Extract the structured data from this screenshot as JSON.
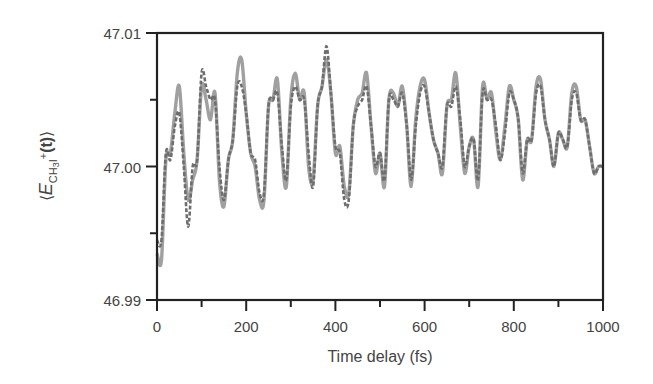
{
  "chart_data": {
    "type": "line",
    "title": "",
    "xlabel": "Time delay (fs)",
    "ylabel": "⟨E_CH3I+(t)⟩",
    "ylabel_parts": {
      "open": "⟨",
      "E": "E",
      "sub": "CH",
      "sub3": "3",
      "subI": "I",
      "sup": "+",
      "t": "(t)",
      "close": "⟩"
    },
    "xlim": [
      0,
      1000
    ],
    "ylim": [
      46.99,
      47.01
    ],
    "x_ticks": [
      0,
      200,
      400,
      600,
      800,
      1000
    ],
    "x_tick_labels": [
      "0",
      "200",
      "400",
      "600",
      "800",
      "1000"
    ],
    "x_minor_ticks": [
      100,
      300,
      500,
      700,
      900
    ],
    "y_ticks": [
      46.99,
      47.0,
      47.01
    ],
    "y_tick_labels": [
      "46.99",
      "47.00",
      "47.01"
    ],
    "y_minor_ticks": [
      46.995,
      47.005
    ],
    "grid": false,
    "legend": null,
    "series": [
      {
        "name": "solid",
        "style": "solid",
        "color": "#a0a0a0",
        "x": [
          0,
          10,
          20,
          30,
          40,
          50,
          60,
          70,
          80,
          90,
          100,
          110,
          120,
          130,
          140,
          150,
          160,
          170,
          180,
          190,
          200,
          210,
          220,
          230,
          240,
          250,
          260,
          270,
          280,
          290,
          300,
          310,
          320,
          330,
          340,
          350,
          360,
          370,
          380,
          390,
          400,
          410,
          420,
          430,
          440,
          450,
          460,
          470,
          480,
          490,
          500,
          510,
          520,
          530,
          540,
          550,
          560,
          570,
          580,
          590,
          600,
          610,
          620,
          630,
          640,
          650,
          660,
          670,
          680,
          690,
          700,
          710,
          720,
          730,
          740,
          750,
          760,
          770,
          780,
          790,
          800,
          810,
          820,
          830,
          840,
          850,
          860,
          870,
          880,
          890,
          900,
          910,
          920,
          930,
          940,
          950,
          960,
          970,
          980,
          990,
          1000
        ],
        "y": [
          46.9935,
          46.993,
          47.0005,
          47.001,
          47.004,
          47.006,
          47.001,
          46.9975,
          46.999,
          47.0005,
          47.006,
          47.005,
          47.0035,
          47.0055,
          46.999,
          46.997,
          47.0005,
          47.002,
          47.007,
          47.008,
          47.004,
          47.001,
          47.0,
          46.9975,
          46.9975,
          47.0045,
          47.005,
          47.0065,
          47.001,
          46.9985,
          47.005,
          47.007,
          47.005,
          47.0055,
          47.0,
          46.999,
          47.0045,
          47.006,
          47.008,
          47.0055,
          47.001,
          47.0015,
          46.9985,
          46.998,
          47.003,
          47.005,
          47.0055,
          47.007,
          47.003,
          46.9995,
          47.001,
          46.9985,
          47.005,
          47.0055,
          47.0045,
          47.006,
          47.003,
          46.9985,
          47.0035,
          47.006,
          47.0065,
          47.004,
          47.002,
          47.001,
          46.9995,
          47.0045,
          47.005,
          47.007,
          47.003,
          46.9995,
          47.0015,
          47.002,
          46.9985,
          47.006,
          47.005,
          47.0055,
          47.0025,
          47.0005,
          47.003,
          47.006,
          47.005,
          47.0035,
          46.999,
          47.002,
          47.002,
          47.006,
          47.0065,
          47.0035,
          47.002,
          47.0,
          47.0025,
          47.002,
          47.0015,
          47.0055,
          47.006,
          47.0035,
          47.0035,
          47.0015,
          46.9995,
          47.0,
          47.0
        ]
      },
      {
        "name": "dashed",
        "style": "dashed",
        "color": "#6e6e6e",
        "x": [
          0,
          10,
          20,
          30,
          40,
          50,
          60,
          70,
          80,
          90,
          100,
          110,
          120,
          130,
          140,
          150,
          160,
          170,
          180,
          190,
          200,
          210,
          220,
          230,
          240,
          250,
          260,
          270,
          280,
          290,
          300,
          310,
          320,
          330,
          340,
          350,
          360,
          370,
          380,
          390,
          400,
          410,
          420,
          430,
          440,
          450,
          460,
          470,
          480,
          490,
          500,
          510,
          520,
          530,
          540,
          550,
          560,
          570,
          580,
          590,
          600,
          610,
          620,
          630,
          640,
          650,
          660,
          670,
          680,
          690,
          700,
          710,
          720,
          730,
          740,
          750,
          760,
          770,
          780,
          790,
          800,
          810,
          820,
          830,
          840,
          850,
          860,
          870,
          880,
          890,
          900,
          910,
          920,
          930,
          940,
          950,
          960,
          970,
          980,
          990,
          1000
        ],
        "y": [
          46.9945,
          46.9945,
          47.001,
          47.0005,
          47.003,
          47.004,
          47.0,
          46.9955,
          47.0,
          47.0005,
          47.007,
          47.006,
          47.005,
          47.005,
          47.0,
          46.9975,
          47.0005,
          47.002,
          47.006,
          47.006,
          47.004,
          47.001,
          47.0005,
          46.998,
          46.998,
          47.0045,
          47.005,
          47.0055,
          47.0015,
          46.999,
          47.0045,
          47.006,
          47.005,
          47.005,
          47.001,
          46.9985,
          47.0045,
          47.006,
          47.009,
          47.0055,
          47.0015,
          47.001,
          46.9975,
          46.9975,
          47.003,
          47.0045,
          47.005,
          47.006,
          47.003,
          47.0,
          47.001,
          46.999,
          47.005,
          47.005,
          47.0045,
          47.0055,
          47.003,
          46.999,
          47.003,
          47.0055,
          47.006,
          47.004,
          47.002,
          47.001,
          47.0,
          47.0045,
          47.0045,
          47.006,
          47.0035,
          47.0,
          47.0015,
          47.002,
          46.999,
          47.0055,
          47.005,
          47.005,
          47.003,
          47.0005,
          47.0025,
          47.0055,
          47.005,
          47.0035,
          46.9995,
          47.002,
          47.002,
          47.0055,
          47.006,
          47.0035,
          47.002,
          47.0,
          47.0025,
          47.002,
          47.0015,
          47.005,
          47.0055,
          47.0035,
          47.0035,
          47.0015,
          46.9995,
          47.0,
          47.0
        ]
      }
    ]
  }
}
